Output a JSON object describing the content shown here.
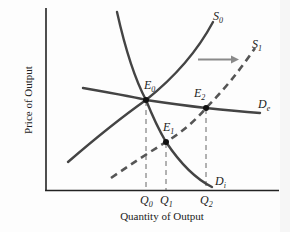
{
  "diagram": {
    "y_axis_label": "Price of Output",
    "x_axis_label": "Quantity of Output",
    "curves": {
      "S0": {
        "letter": "S",
        "sub": "0",
        "style": "solid"
      },
      "S1": {
        "letter": "S",
        "sub": "1",
        "style": "dashed"
      },
      "De": {
        "letter": "D",
        "sub": "e",
        "style": "solid"
      },
      "Di": {
        "letter": "D",
        "sub": "i",
        "style": "solid"
      }
    },
    "points": {
      "E0": {
        "letter": "E",
        "sub": "0"
      },
      "E1": {
        "letter": "E",
        "sub": "1"
      },
      "E2": {
        "letter": "E",
        "sub": "2"
      }
    },
    "ticks": {
      "Q0": {
        "letter": "Q",
        "sub": "0"
      },
      "Q1": {
        "letter": "Q",
        "sub": "1"
      },
      "Q2": {
        "letter": "Q",
        "sub": "2"
      }
    },
    "shift_arrow": {
      "direction": "right",
      "meaning": "supply shift S0 to S1"
    },
    "colors": {
      "curve": "#444444",
      "arrow": "#8a8a8a",
      "axis": "#222222",
      "guide": "#555555",
      "background": "#fdfdfd"
    }
  }
}
